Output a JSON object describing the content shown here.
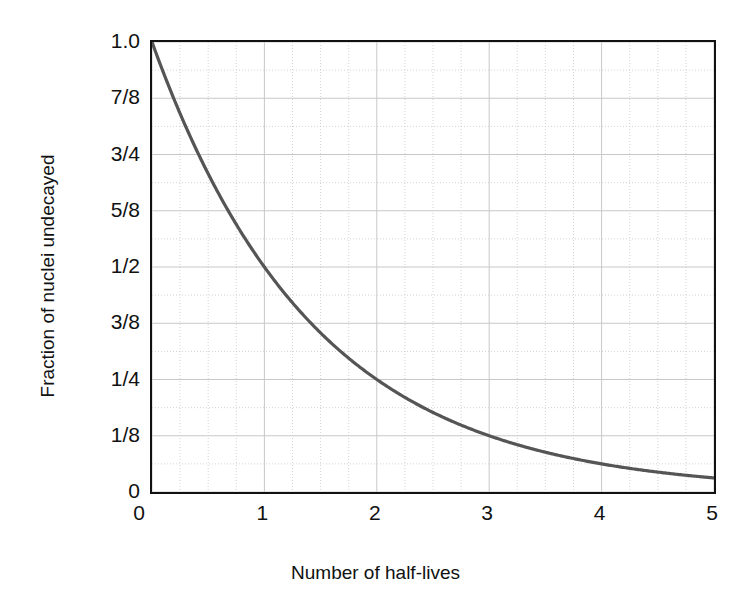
{
  "chart_data": {
    "type": "line",
    "title": "",
    "xlabel": "Number of half-lives",
    "ylabel": "Fraction of nuclei undecayed",
    "xlim": [
      0,
      5
    ],
    "ylim": [
      0,
      1
    ],
    "grid": true,
    "legend": "none",
    "line_color": "#555555",
    "axis_color": "#111111",
    "grid_color": "#c8c8c8",
    "background": "#ffffff",
    "xticks": [
      {
        "value": 0,
        "label": "0"
      },
      {
        "value": 1,
        "label": "1"
      },
      {
        "value": 2,
        "label": "2"
      },
      {
        "value": 3,
        "label": "3"
      },
      {
        "value": 4,
        "label": "4"
      },
      {
        "value": 5,
        "label": "5"
      }
    ],
    "yticks": [
      {
        "value": 1.0,
        "label": "1.0"
      },
      {
        "value": 0.875,
        "label": "7/8"
      },
      {
        "value": 0.75,
        "label": "3/4"
      },
      {
        "value": 0.625,
        "label": "5/8"
      },
      {
        "value": 0.5,
        "label": "1/2"
      },
      {
        "value": 0.375,
        "label": "3/8"
      },
      {
        "value": 0.25,
        "label": "1/4"
      },
      {
        "value": 0.125,
        "label": "1/8"
      },
      {
        "value": 0.0,
        "label": "0"
      }
    ],
    "x_minor_step": 0.25,
    "y_minor_step": 0.0625,
    "series": [
      {
        "name": "Fraction undecayed",
        "formula": "y = (1/2)^x",
        "x": [
          0,
          0.25,
          0.5,
          0.75,
          1,
          1.25,
          1.5,
          1.75,
          2,
          2.25,
          2.5,
          2.75,
          3,
          3.25,
          3.5,
          3.75,
          4,
          4.25,
          4.5,
          4.75,
          5
        ],
        "values": [
          1.0,
          0.841,
          0.707,
          0.595,
          0.5,
          0.42,
          0.354,
          0.297,
          0.25,
          0.21,
          0.177,
          0.149,
          0.125,
          0.105,
          0.0884,
          0.0743,
          0.0625,
          0.0526,
          0.0442,
          0.0372,
          0.03125
        ]
      }
    ],
    "annotations": []
  }
}
